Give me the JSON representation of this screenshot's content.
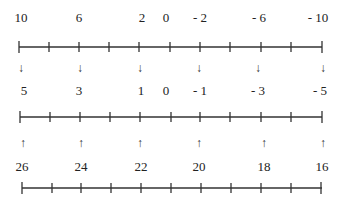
{
  "diagram": {
    "type": "number-line-mapping",
    "line_color": "#333333",
    "rows": [
      {
        "name": "top-line",
        "labels": [
          {
            "text": "10",
            "tick": 0
          },
          {
            "text": "6",
            "tick": 2
          },
          {
            "text": "2",
            "tick": 4
          },
          {
            "text": "0",
            "tick": 5
          },
          {
            "text": "- 2",
            "tick": 6
          },
          {
            "text": "- 6",
            "tick": 8
          },
          {
            "text": "- 10",
            "tick": 10
          }
        ],
        "tick_count": 11
      },
      {
        "name": "middle-line",
        "arrows_above": {
          "direction": "down",
          "glyph": "↓",
          "ticks": [
            0,
            2,
            4,
            6,
            8,
            10
          ]
        },
        "labels": [
          {
            "text": "5",
            "tick": 0
          },
          {
            "text": "3",
            "tick": 2
          },
          {
            "text": "1",
            "tick": 4
          },
          {
            "text": "0",
            "tick": 5
          },
          {
            "text": "- 1",
            "tick": 6
          },
          {
            "text": "- 3",
            "tick": 8
          },
          {
            "text": "- 5",
            "tick": 10
          }
        ],
        "tick_count": 11
      },
      {
        "name": "bottom-line",
        "arrows_above": {
          "direction": "up",
          "glyph": "↑",
          "ticks": [
            0,
            2,
            4,
            6,
            8,
            10
          ]
        },
        "labels": [
          {
            "text": "26",
            "tick": 0
          },
          {
            "text": "24",
            "tick": 2
          },
          {
            "text": "22",
            "tick": 4
          },
          {
            "text": "20",
            "tick": 6
          },
          {
            "text": "18",
            "tick": 8
          },
          {
            "text": "16",
            "tick": 10
          }
        ],
        "tick_count": 11
      }
    ],
    "text": {
      "top": [
        "10",
        "6",
        "2",
        "0",
        "- 2",
        "- 6",
        "- 10"
      ],
      "middle": [
        "5",
        "3",
        "1",
        "0",
        "- 1",
        "- 3",
        "- 5"
      ],
      "bottom": [
        "26",
        "24",
        "22",
        "20",
        "18",
        "16"
      ],
      "down_arrow": "↓",
      "up_arrow": "↑"
    }
  }
}
